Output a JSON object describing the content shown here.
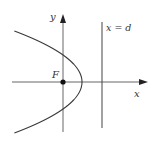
{
  "diagram": {
    "colors": {
      "stroke": "#3a3a3a",
      "axis": "#555555",
      "background": "#ffffff"
    },
    "labels": {
      "y_axis": "y",
      "x_axis": "x",
      "focus": "F",
      "directrix": "x = d"
    },
    "geometry": {
      "origin": [
        63,
        82
      ],
      "focus": [
        63,
        82
      ],
      "vertex": [
        82,
        82
      ],
      "directrix_x": 102,
      "directrix_y_range": [
        22,
        128
      ],
      "x_axis_range": [
        12,
        148
      ],
      "y_axis_range": [
        14,
        132
      ],
      "parabola_k": 0.026,
      "parabola_y_range": [
        31,
        133
      ]
    }
  }
}
